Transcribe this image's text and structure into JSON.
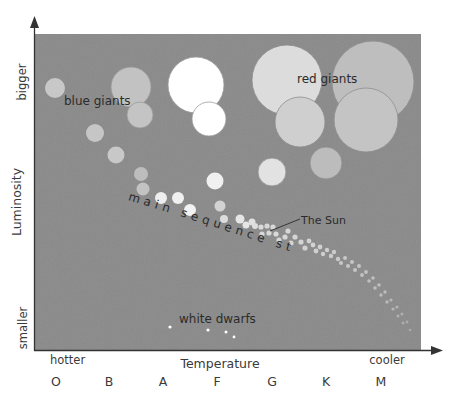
{
  "chart_data": {
    "type": "scatter",
    "xlabel": "Temperature",
    "ylabel": "Luminosity",
    "x_axis": {
      "label": "Temperature",
      "left_end_label": "hotter",
      "right_end_label": "cooler",
      "spectral_classes": [
        "O",
        "B",
        "A",
        "F",
        "G",
        "K",
        "M"
      ]
    },
    "y_axis": {
      "label": "Luminosity",
      "top_label": "bigger",
      "bottom_label": "smaller"
    },
    "grid": false,
    "legend": null,
    "annotations": [
      {
        "text": "blue giants",
        "x": 64,
        "y": 101,
        "size": 12
      },
      {
        "text": "red giants",
        "x": 298,
        "y": 83,
        "size": 12
      },
      {
        "text": "main sequence stars",
        "curved": true
      },
      {
        "text": "The Sun",
        "x": 302,
        "y": 223,
        "size": 11,
        "pointer_to": [
          270,
          231
        ]
      },
      {
        "text": "white dwarfs",
        "x": 180,
        "y": 323,
        "size": 12
      }
    ],
    "groups": {
      "blue_giants": [
        {
          "cx": 55,
          "cy": 88,
          "r": 10,
          "color": "#c8c8c8"
        },
        {
          "cx": 131,
          "cy": 87,
          "r": 20,
          "color": "#c2c2c2"
        },
        {
          "cx": 140,
          "cy": 115,
          "r": 13,
          "color": "#c4c4c4"
        },
        {
          "cx": 95,
          "cy": 133,
          "r": 9,
          "color": "#c6c6c6"
        },
        {
          "cx": 116,
          "cy": 155,
          "r": 8.5,
          "color": "#c8c8c8"
        }
      ],
      "white_giants": [
        {
          "cx": 196,
          "cy": 85,
          "r": 28,
          "color": "#ffffff"
        },
        {
          "cx": 209,
          "cy": 119,
          "r": 17,
          "color": "#ffffff"
        }
      ],
      "red_giants": [
        {
          "cx": 287,
          "cy": 80,
          "r": 35,
          "color": "#dcdcdc"
        },
        {
          "cx": 373,
          "cy": 82,
          "r": 41,
          "color": "#bebebe"
        },
        {
          "cx": 300,
          "cy": 122,
          "r": 25,
          "color": "#cfcfcf"
        },
        {
          "cx": 366,
          "cy": 120,
          "r": 32,
          "color": "#c4c4c4"
        },
        {
          "cx": 326,
          "cy": 163,
          "r": 16,
          "color": "#bcbcbc"
        },
        {
          "cx": 272,
          "cy": 172,
          "r": 14,
          "color": "#e2e2e2"
        }
      ],
      "main_sequence": [
        {
          "cx": 141,
          "cy": 174,
          "r": 7,
          "color": "#bdbdbd"
        },
        {
          "cx": 143,
          "cy": 189,
          "r": 6.5,
          "color": "#c3c3c3"
        },
        {
          "cx": 161,
          "cy": 198,
          "r": 6,
          "color": "#eeeeee"
        },
        {
          "cx": 178,
          "cy": 198,
          "r": 6,
          "color": "#f0f0f0"
        },
        {
          "cx": 190,
          "cy": 210,
          "r": 6,
          "color": "#f2f2f2"
        },
        {
          "cx": 215,
          "cy": 181,
          "r": 8.5,
          "color": "#f0f0f0"
        },
        {
          "cx": 220,
          "cy": 206,
          "r": 5.5,
          "color": "#d2d2d2"
        },
        {
          "cx": 224,
          "cy": 219,
          "r": 4,
          "color": "#dcdcdc"
        },
        {
          "cx": 240,
          "cy": 219,
          "r": 4.5,
          "color": "#e6e6e6"
        },
        {
          "cx": 246,
          "cy": 225,
          "r": 3.5,
          "color": "#e6e6e6"
        },
        {
          "cx": 252,
          "cy": 222,
          "r": 3.5,
          "color": "#e0e0e0"
        },
        {
          "cx": 255,
          "cy": 226,
          "r": 3,
          "color": "#dedede"
        },
        {
          "cx": 261,
          "cy": 227,
          "r": 2.6,
          "color": "#dadada"
        },
        {
          "cx": 267,
          "cy": 226,
          "r": 2.6,
          "color": "#d8d8d8"
        },
        {
          "cx": 273,
          "cy": 227,
          "r": 2.6,
          "color": "#d8d8d8"
        },
        {
          "cx": 262,
          "cy": 234,
          "r": 2.6,
          "color": "#d8d8d8"
        },
        {
          "cx": 269,
          "cy": 233,
          "r": 2.6,
          "color": "#d8d8d8"
        },
        {
          "cx": 276,
          "cy": 234,
          "r": 2.6,
          "color": "#d8d8d8"
        },
        {
          "cx": 279,
          "cy": 240,
          "r": 2.6,
          "color": "#d6d6d6"
        },
        {
          "cx": 285,
          "cy": 237,
          "r": 2.6,
          "color": "#d6d6d6"
        },
        {
          "cx": 288,
          "cy": 231,
          "r": 2.6,
          "color": "#d6d6d6"
        },
        {
          "cx": 291,
          "cy": 243,
          "r": 2.6,
          "color": "#d4d4d4"
        },
        {
          "cx": 295,
          "cy": 237,
          "r": 2.6,
          "color": "#d4d4d4"
        },
        {
          "cx": 301,
          "cy": 242,
          "r": 2.6,
          "color": "#d4d4d4"
        },
        {
          "cx": 305,
          "cy": 248,
          "r": 2.6,
          "color": "#d2d2d2"
        },
        {
          "cx": 309,
          "cy": 241,
          "r": 2.4,
          "color": "#d2d2d2"
        },
        {
          "cx": 313,
          "cy": 245,
          "r": 2.4,
          "color": "#d2d2d2"
        },
        {
          "cx": 316,
          "cy": 251,
          "r": 2.4,
          "color": "#d0d0d0"
        },
        {
          "cx": 320,
          "cy": 247,
          "r": 2.4,
          "color": "#d0d0d0"
        },
        {
          "cx": 323,
          "cy": 254,
          "r": 2.2,
          "color": "#cecece"
        },
        {
          "cx": 327,
          "cy": 250,
          "r": 2.2,
          "color": "#cecece"
        },
        {
          "cx": 331,
          "cy": 256,
          "r": 2.2,
          "color": "#cccccc"
        },
        {
          "cx": 334,
          "cy": 252,
          "r": 2.2,
          "color": "#cccccc"
        },
        {
          "cx": 338,
          "cy": 259,
          "r": 2.2,
          "color": "#cacaca"
        },
        {
          "cx": 341,
          "cy": 263,
          "r": 2,
          "color": "#c8c8c8"
        },
        {
          "cx": 345,
          "cy": 258,
          "r": 2,
          "color": "#c8c8c8"
        },
        {
          "cx": 348,
          "cy": 266,
          "r": 2,
          "color": "#c6c6c6"
        },
        {
          "cx": 352,
          "cy": 262,
          "r": 2,
          "color": "#c6c6c6"
        },
        {
          "cx": 355,
          "cy": 270,
          "r": 2,
          "color": "#c4c4c4"
        },
        {
          "cx": 359,
          "cy": 266,
          "r": 2,
          "color": "#c4c4c4"
        },
        {
          "cx": 362,
          "cy": 275,
          "r": 1.9,
          "color": "#c2c2c2"
        },
        {
          "cx": 366,
          "cy": 272,
          "r": 1.9,
          "color": "#c2c2c2"
        },
        {
          "cx": 369,
          "cy": 281,
          "r": 1.8,
          "color": "#c0c0c0"
        },
        {
          "cx": 373,
          "cy": 278,
          "r": 1.8,
          "color": "#c0c0c0"
        },
        {
          "cx": 375,
          "cy": 288,
          "r": 1.8,
          "color": "#bebebe"
        },
        {
          "cx": 379,
          "cy": 285,
          "r": 1.8,
          "color": "#bebebe"
        },
        {
          "cx": 381,
          "cy": 295,
          "r": 1.7,
          "color": "#bcbcbc"
        },
        {
          "cx": 385,
          "cy": 292,
          "r": 1.7,
          "color": "#bcbcbc"
        },
        {
          "cx": 387,
          "cy": 302,
          "r": 1.7,
          "color": "#bababa"
        },
        {
          "cx": 391,
          "cy": 300,
          "r": 1.6,
          "color": "#b8b8b8"
        },
        {
          "cx": 393,
          "cy": 309,
          "r": 1.6,
          "color": "#b6b6b6"
        },
        {
          "cx": 397,
          "cy": 307,
          "r": 1.6,
          "color": "#b4b4b4"
        },
        {
          "cx": 398,
          "cy": 316,
          "r": 1.5,
          "color": "#b2b2b2"
        },
        {
          "cx": 402,
          "cy": 314,
          "r": 1.5,
          "color": "#b0b0b0"
        },
        {
          "cx": 403,
          "cy": 323,
          "r": 1.4,
          "color": "#aeaeae"
        },
        {
          "cx": 407,
          "cy": 322,
          "r": 1.4,
          "color": "#acacac"
        },
        {
          "cx": 410,
          "cy": 330,
          "r": 1.3,
          "color": "#aaaaaa"
        }
      ],
      "white_dwarfs": [
        {
          "cx": 170,
          "cy": 327,
          "r": 1.6,
          "color": "#ffffff"
        },
        {
          "cx": 208,
          "cy": 330,
          "r": 1.6,
          "color": "#ffffff"
        },
        {
          "cx": 226,
          "cy": 332,
          "r": 1.5,
          "color": "#ffffff"
        },
        {
          "cx": 234,
          "cy": 337,
          "r": 1.4,
          "color": "#ffffff"
        }
      ]
    }
  },
  "colors": {
    "plot_background": "#8a8a8a",
    "axis": "#333333",
    "text": "#2b2b2b"
  },
  "labels": {
    "y_top": "bigger",
    "y_mid": "Luminosity",
    "y_bottom": "smaller",
    "x_left": "hotter",
    "x_mid": "Temperature",
    "x_right": "cooler",
    "blue_giants": "blue giants",
    "red_giants": "red giants",
    "main_sequence": "main sequence stars",
    "the_sun": "The Sun",
    "white_dwarfs": "white dwarfs",
    "classes": [
      "O",
      "B",
      "A",
      "F",
      "G",
      "K",
      "M"
    ]
  }
}
